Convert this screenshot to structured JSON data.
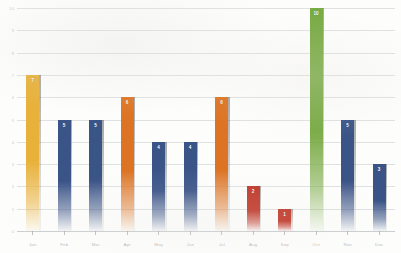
{
  "chart_data": {
    "type": "bar",
    "title": "",
    "xlabel": "",
    "ylabel": "",
    "ylim": [
      0,
      10
    ],
    "grid": true,
    "legend": "none",
    "categories": [
      "Jan",
      "Feb",
      "Mar",
      "Apr",
      "May",
      "Jun",
      "Jul",
      "Aug",
      "Sep",
      "Oct",
      "Nov",
      "Dec"
    ],
    "values": [
      7,
      5,
      5,
      6,
      4,
      4,
      6,
      2,
      1,
      10,
      5,
      3
    ],
    "value_labels": [
      "7",
      "5",
      "5",
      "6",
      "4",
      "4",
      "6",
      "2",
      "1",
      "10",
      "5",
      "3"
    ],
    "bar_colors": [
      "#e8b13a",
      "#3b5488",
      "#3b5488",
      "#dd7424",
      "#3b5488",
      "#3b5488",
      "#dd7424",
      "#c0392b",
      "#c0392b",
      "#7aab46",
      "#3b5488",
      "#3b5488"
    ],
    "y_ticks": [
      0,
      1,
      2,
      3,
      4,
      5,
      6,
      7,
      8,
      9,
      10
    ],
    "y_tick_labels": [
      "0",
      "1",
      "2",
      "3",
      "4",
      "5",
      "6",
      "7",
      "8",
      "9",
      "10"
    ],
    "series": [
      {
        "name": "Series 1",
        "values": [
          7,
          5,
          5,
          6,
          4,
          4,
          6,
          2,
          1,
          10,
          5,
          3
        ]
      }
    ]
  },
  "style": {
    "background": "#fdfdfc",
    "gridline_color": "#c8cbce",
    "axis_text_color": "#8c8e92",
    "value_label_color": "#ffffff"
  }
}
